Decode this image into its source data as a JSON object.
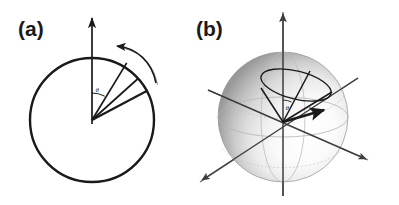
{
  "figure": {
    "background_color": "#ffffff",
    "stroke_color": "#1a1a1a",
    "panels": [
      {
        "id": "panel-a",
        "label": "(a)",
        "label_x": 18,
        "label_y": 36,
        "type": "2d-circle-precession",
        "circle": {
          "cx": 92,
          "cy": 120,
          "r": 62,
          "stroke": "#1a1a1a",
          "stroke_width": 2.4
        },
        "axis": {
          "name": "vertical-axis",
          "x": 92,
          "y_top": 14,
          "y_bottom": 124,
          "stroke_width": 1.6,
          "arrow": "up"
        },
        "angle_label": {
          "text": "θ",
          "x": 95,
          "y": 93
        },
        "angle_arc": {
          "cx": 92,
          "cy": 120,
          "r": 27,
          "from_deg": -90,
          "to_deg": -62
        },
        "vectors": [
          {
            "name": "spin-vector-1",
            "angle_deg": -62,
            "length": 62,
            "stroke_width": 1.7
          },
          {
            "name": "spin-vector-2",
            "angle_deg": -48,
            "length": 62,
            "stroke_width": 1.7
          },
          {
            "name": "spin-vector-3",
            "angle_deg": -28,
            "length": 62,
            "stroke_width": 2.1
          }
        ],
        "rotation_arrow": {
          "name": "precession-arrow",
          "direction": "counterclockwise",
          "start_x": 156,
          "start_y": 83,
          "end_x": 117,
          "end_y": 46,
          "stroke_width": 1.6
        }
      },
      {
        "id": "panel-b",
        "label": "(b)",
        "label_x": 196,
        "label_y": 36,
        "type": "3d-sphere-cone",
        "sphere": {
          "cx": 283,
          "cy": 117,
          "r": 65,
          "rim_color": "#8c8c8c",
          "highlight_color": "#ffffff",
          "shadow_color": "#9a9a9a"
        },
        "equator": {
          "cx": 283,
          "cy": 117,
          "rx": 65,
          "ry": 20,
          "stroke": "#b0b0b0"
        },
        "meridian": {
          "cx": 283,
          "cy": 117,
          "rx": 22,
          "ry": 65,
          "stroke": "#b0b0b0"
        },
        "axes": [
          {
            "name": "vertical-axis",
            "x1": 283,
            "y1": 196,
            "x2": 283,
            "y2": 12,
            "arrow": "up",
            "stroke": "#5a5a5a"
          },
          {
            "name": "oblique-axis-right",
            "x1": 208,
            "y1": 90,
            "x2": 368,
            "y2": 160,
            "arrow": "end",
            "stroke": "#5a5a5a"
          },
          {
            "name": "oblique-axis-left",
            "x1": 358,
            "y1": 78,
            "x2": 200,
            "y2": 182,
            "arrow": "end",
            "stroke": "#5a5a5a"
          }
        ],
        "cone": {
          "apex_x": 283,
          "apex_y": 122,
          "base_ellipse": {
            "cx": 296,
            "cy": 85,
            "rx": 36,
            "ry": 14,
            "rotation_deg": 14
          },
          "stroke_width": 1.5
        },
        "vectors": [
          {
            "name": "cone-edge-1",
            "x": 262,
            "y": 89,
            "stroke_width": 1.5
          },
          {
            "name": "cone-edge-2",
            "x": 309,
            "y": 72,
            "stroke_width": 1.5
          },
          {
            "name": "cone-edge-3",
            "x": 331,
            "y": 92,
            "stroke_width": 1.5
          },
          {
            "name": "spin-vector-main",
            "x": 326,
            "y": 110,
            "stroke_width": 2.6
          }
        ],
        "angle_label": {
          "text": "θ",
          "x": 287,
          "y": 110
        }
      }
    ]
  }
}
